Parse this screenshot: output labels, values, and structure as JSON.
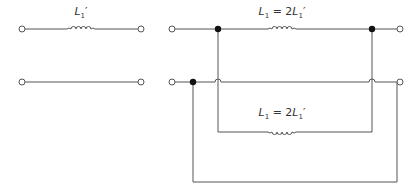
{
  "diagram": {
    "type": "circuit",
    "left_circuit": {
      "inductor_label": "L1'",
      "label_parts": {
        "sym": "L",
        "sub": "1",
        "prime": "′",
        "rhs": ""
      }
    },
    "right_circuit": {
      "top_inductor_label": "L1 = 2L1'",
      "bottom_inductor_label": "L1 = 2L1'",
      "label_parts": {
        "sym": "L",
        "sub": "1",
        "eq": " = 2",
        "sym2": "L",
        "sub2": "1",
        "prime": "′"
      }
    },
    "colors": {
      "wire": "#555555",
      "node": "#111111",
      "terminal_fill": "#ffffff"
    }
  }
}
